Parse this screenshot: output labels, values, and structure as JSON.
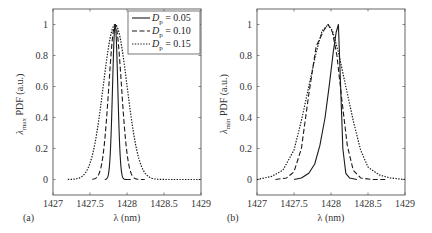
{
  "chart_data": [
    {
      "panel_label": "(a)",
      "type": "line",
      "title": "",
      "xlabel": "λ (nm)",
      "ylabel": "λmax PDF (a.u.)",
      "ylabel_main": "λ",
      "ylabel_sub": "max",
      "ylabel_rest": " PDF (a.u.)",
      "xlim": [
        1427,
        1429
      ],
      "ylim": [
        -0.1,
        1.1
      ],
      "xticks": [
        1427,
        1427.5,
        1428,
        1428.5,
        1429
      ],
      "xtick_labels": [
        "1427",
        "1427.5",
        "1428",
        "1428.5",
        "1429"
      ],
      "yticks": [
        0,
        0.2,
        0.4,
        0.6,
        0.8,
        1
      ],
      "ytick_labels": [
        "0",
        "0.2",
        "0.4",
        "0.6",
        "0.8",
        "1"
      ],
      "grid": false,
      "legend_position": "upper right",
      "series": [
        {
          "name": "Dp = 0.05",
          "style": "solid",
          "center": 1427.84,
          "sigma": 0.035,
          "x_range": [
            1427.7,
            1428.05
          ],
          "x": [
            1427.7,
            1427.75,
            1427.78,
            1427.8,
            1427.82,
            1427.84,
            1427.86,
            1427.88,
            1427.9,
            1427.93,
            1427.97,
            1428.05
          ],
          "values": [
            0.0,
            0.05,
            0.25,
            0.52,
            0.85,
            1.0,
            0.85,
            0.52,
            0.25,
            0.08,
            0.01,
            0.0
          ]
        },
        {
          "name": "Dp = 0.10",
          "style": "dashed",
          "center": 1427.84,
          "sigma": 0.085,
          "x_range": [
            1427.53,
            1428.24
          ],
          "x": [
            1427.53,
            1427.6,
            1427.65,
            1427.7,
            1427.75,
            1427.8,
            1427.84,
            1427.88,
            1427.93,
            1427.98,
            1428.03,
            1428.08,
            1428.15,
            1428.24
          ],
          "values": [
            0.0,
            0.02,
            0.08,
            0.25,
            0.57,
            0.89,
            1.0,
            0.89,
            0.57,
            0.25,
            0.08,
            0.02,
            0.005,
            0.0
          ]
        },
        {
          "name": "Dp = 0.15",
          "style": "dotted",
          "center": 1427.84,
          "sigma": 0.16,
          "x_range": [
            1427.2,
            1429.0
          ],
          "x": [
            1427.2,
            1427.35,
            1427.45,
            1427.55,
            1427.65,
            1427.75,
            1427.84,
            1427.93,
            1428.03,
            1428.13,
            1428.23,
            1428.35,
            1428.5,
            1428.7,
            1429.0
          ],
          "values": [
            0.0,
            0.01,
            0.05,
            0.19,
            0.49,
            0.85,
            1.0,
            0.85,
            0.49,
            0.19,
            0.05,
            0.01,
            0.0,
            0.0,
            0.0
          ]
        }
      ]
    },
    {
      "panel_label": "(b)",
      "type": "line",
      "title": "",
      "xlabel": "λ (nm)",
      "ylabel": "λmin PDF (a.u.)",
      "ylabel_main": "λ",
      "ylabel_sub": "min",
      "ylabel_rest": " PDF (a.u.)",
      "xlim": [
        1427,
        1429
      ],
      "ylim": [
        -0.1,
        1.1
      ],
      "xticks": [
        1427,
        1427.5,
        1428,
        1428.5,
        1429
      ],
      "xtick_labels": [
        "1427",
        "1427.5",
        "1428",
        "1428.5",
        "1429"
      ],
      "yticks": [
        0,
        0.2,
        0.4,
        0.6,
        0.8,
        1
      ],
      "ytick_labels": [
        "0",
        "0.2",
        "0.4",
        "0.6",
        "0.8",
        "1"
      ],
      "grid": false,
      "series": [
        {
          "name": "Dp = 0.05",
          "style": "solid",
          "x": [
            1427.5,
            1427.6,
            1427.7,
            1427.78,
            1427.85,
            1427.92,
            1427.98,
            1428.03,
            1428.07,
            1428.1,
            1428.13,
            1428.16,
            1428.2,
            1428.25,
            1428.35
          ],
          "values": [
            0.0,
            0.01,
            0.04,
            0.1,
            0.22,
            0.4,
            0.62,
            0.82,
            0.95,
            1.0,
            0.6,
            0.2,
            0.04,
            0.01,
            0.0
          ]
        },
        {
          "name": "Dp = 0.10",
          "style": "dashed",
          "x": [
            1427.25,
            1427.4,
            1427.5,
            1427.6,
            1427.7,
            1427.8,
            1427.9,
            1427.96,
            1428.02,
            1428.08,
            1428.15,
            1428.22,
            1428.3,
            1428.4,
            1428.55,
            1428.75
          ],
          "values": [
            0.0,
            0.01,
            0.05,
            0.2,
            0.55,
            0.86,
            0.96,
            1.0,
            0.95,
            0.8,
            0.5,
            0.22,
            0.06,
            0.01,
            0.0,
            0.0
          ]
        },
        {
          "name": "Dp = 0.15",
          "style": "dotted",
          "x": [
            1427.0,
            1427.2,
            1427.35,
            1427.5,
            1427.6,
            1427.7,
            1427.8,
            1427.88,
            1427.96,
            1428.02,
            1428.1,
            1428.2,
            1428.3,
            1428.4,
            1428.5,
            1428.65,
            1428.8,
            1429.0
          ],
          "values": [
            0.0,
            0.02,
            0.06,
            0.19,
            0.38,
            0.6,
            0.82,
            0.96,
            1.0,
            0.96,
            0.82,
            0.6,
            0.38,
            0.19,
            0.08,
            0.03,
            0.01,
            0.0
          ]
        }
      ]
    }
  ],
  "legend": {
    "items": [
      {
        "sym": "D",
        "sub": "p",
        "rest": " = 0.05",
        "style": "solid"
      },
      {
        "sym": "D",
        "sub": "p",
        "rest": " = 0.10",
        "style": "dashed"
      },
      {
        "sym": "D",
        "sub": "p",
        "rest": " = 0.15",
        "style": "dotted"
      }
    ]
  },
  "colors": {
    "line": "#1a1a1a",
    "axis": "#555555",
    "text": "#333333"
  }
}
